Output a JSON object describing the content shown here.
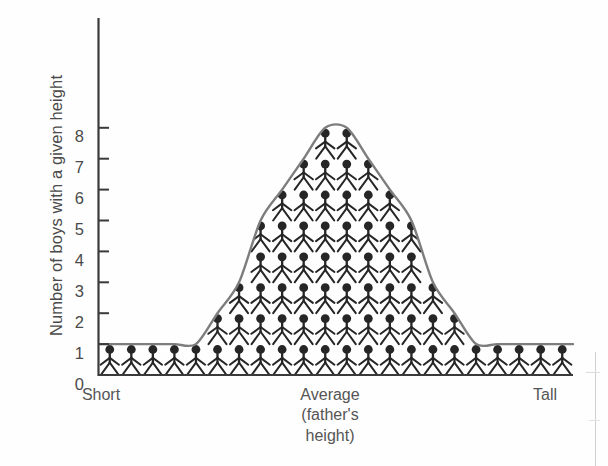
{
  "figure": {
    "title": "",
    "background_color": "#ffffff",
    "text_color": "#4a4a4a",
    "curve_color": "#7d7d7d",
    "figure_color": "#2b2b2b",
    "axis_color": "#3a3a3a"
  },
  "axes": {
    "y_title": "Number of boys with a given height",
    "y_ticks": [
      "8",
      "7",
      "6",
      "5",
      "4",
      "3",
      "2",
      "1",
      "0"
    ],
    "x_labels": {
      "left": "Short",
      "center_line1": "Average",
      "center_line2": "(father's",
      "center_line3": "height)",
      "right": "Tall"
    }
  },
  "chart_data": {
    "type": "bar",
    "xlabel": "Father's height",
    "ylabel": "Number of boys with a given height",
    "ylim": [
      0,
      9
    ],
    "yticks": [
      0,
      1,
      2,
      3,
      4,
      5,
      6,
      7,
      8
    ],
    "grid": false,
    "legend": false,
    "x_category_labels": [
      "Short",
      "Average (father's height)",
      "Tall"
    ],
    "categories": [
      "c1",
      "c2",
      "c3",
      "c4",
      "c5",
      "c6",
      "c7",
      "c8",
      "c9",
      "c10",
      "c11",
      "c12",
      "c13",
      "c14",
      "c15",
      "c16",
      "c17",
      "c18",
      "c19",
      "c20",
      "c21",
      "c22"
    ],
    "values": [
      1,
      1,
      1,
      1,
      1,
      2,
      3,
      5,
      6,
      7,
      8,
      8,
      7,
      6,
      5,
      3,
      2,
      1,
      1,
      1,
      1,
      1
    ],
    "units": "each stick figure = 1 boy",
    "annotation": "Normal (bell-shaped) distribution drawn as a smooth grey curve over columns of stick figures",
    "overlay_curve": {
      "name": "normal distribution curve",
      "color": "#7d7d7d",
      "peak_value": 8,
      "peak_category_index": 10.5,
      "baseline_value": 1
    }
  }
}
